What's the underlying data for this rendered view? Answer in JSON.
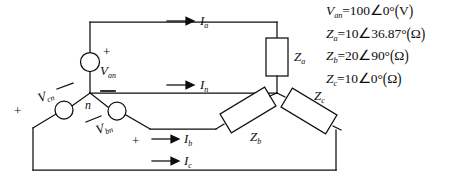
{
  "diagram": {
    "line_color": "#0d0d0d",
    "sources": [
      {
        "id": "van",
        "label_v": "V",
        "label_sub": "an",
        "plus": "+",
        "minus": "−"
      },
      {
        "id": "vcn",
        "label_v": "V",
        "label_sub": "cn",
        "plus": "+",
        "minus": "−"
      },
      {
        "id": "vbn",
        "label_v": "V",
        "label_sub": "bn",
        "plus": "+",
        "minus": "−"
      }
    ],
    "impedances": [
      {
        "id": "za",
        "label_z": "Z",
        "label_sub": "a"
      },
      {
        "id": "zb",
        "label_z": "Z",
        "label_sub": "b"
      },
      {
        "id": "zc",
        "label_z": "Z",
        "label_sub": "c"
      }
    ],
    "currents": [
      {
        "id": "ia",
        "label_i": "I",
        "label_sub": "a"
      },
      {
        "id": "in",
        "label_i": "I",
        "label_sub": "n"
      },
      {
        "id": "ib",
        "label_i": "I",
        "label_sub": "b"
      },
      {
        "id": "ic",
        "label_i": "I",
        "label_sub": "c"
      }
    ],
    "nodes": [
      {
        "id": "neutral",
        "label": "n"
      }
    ]
  },
  "equations": [
    {
      "id": "van",
      "sym": "V",
      "sub": "an",
      "eq": "=",
      "magnitude": "100",
      "angle_glyph": "∠",
      "angle": "0",
      "degree": "°",
      "unit": "V",
      "text": "V_an = 100∠0° (V)"
    },
    {
      "id": "za",
      "sym": "Z",
      "sub": "a",
      "eq": "=",
      "magnitude": "10",
      "angle_glyph": "∠",
      "angle": "36.87",
      "degree": "°",
      "unit": "Ω",
      "text": "Z_a = 10∠36.87° (Ω)"
    },
    {
      "id": "zb",
      "sym": "Z",
      "sub": "b",
      "eq": "=",
      "magnitude": "20",
      "angle_glyph": "∠",
      "angle": "90",
      "degree": "°",
      "unit": "Ω",
      "text": "Z_b = 20∠90° (Ω)"
    },
    {
      "id": "zc",
      "sym": "Z",
      "sub": "c",
      "eq": "=",
      "magnitude": "10",
      "angle_glyph": "∠",
      "angle": "0",
      "degree": "°",
      "unit": "Ω",
      "text": "Z_c = 10∠0° (Ω)"
    }
  ]
}
